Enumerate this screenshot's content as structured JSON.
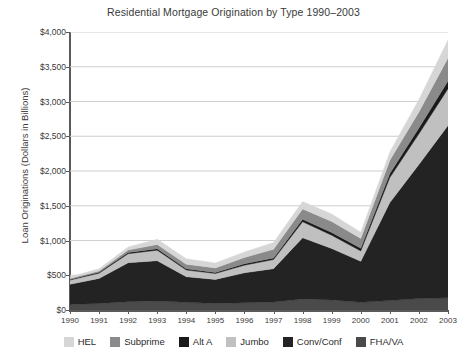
{
  "chart_data": {
    "type": "area",
    "title": "Residential Mortgage Origination by Type 1990–2003",
    "xlabel": "",
    "ylabel": "Loan Originations (Dollars in Billions)",
    "stacked": true,
    "grid": true,
    "legend_position": "bottom",
    "ylim": [
      0,
      4000
    ],
    "ytick_labels": [
      "$4,000",
      "$3,500",
      "$3,000",
      "$2,500",
      "$2,000",
      "$1,500",
      "$1,000",
      "$500",
      "$0"
    ],
    "ytick_values": [
      4000,
      3500,
      3000,
      2500,
      2000,
      1500,
      1000,
      500,
      0
    ],
    "categories": [
      "1990",
      "1991",
      "1992",
      "1993",
      "1994",
      "1995",
      "1996",
      "1997",
      "1998",
      "1999",
      "2000",
      "2001",
      "2002",
      "2003"
    ],
    "stack_order_bottom_to_top": [
      "FHA/VA",
      "Conv/Conf",
      "Jumbo",
      "Alt A",
      "Subprime",
      "HEL"
    ],
    "series": [
      {
        "name": "FHA/VA",
        "color": "#4a4a4a",
        "values": [
          80,
          95,
          120,
          130,
          110,
          95,
          105,
          115,
          160,
          145,
          110,
          135,
          165,
          175
        ]
      },
      {
        "name": "Conv/Conf",
        "color": "#232323",
        "values": [
          290,
          360,
          560,
          580,
          370,
          345,
          430,
          480,
          880,
          740,
          590,
          1410,
          1930,
          2480
        ]
      },
      {
        "name": "Jumbo",
        "color": "#c0c0c0",
        "values": [
          60,
          75,
          130,
          150,
          95,
          85,
          110,
          130,
          230,
          190,
          150,
          360,
          440,
          530
        ]
      },
      {
        "name": "Alt A",
        "color": "#1a1a1a",
        "values": [
          10,
          12,
          18,
          22,
          18,
          16,
          20,
          25,
          35,
          40,
          40,
          60,
          85,
          110
        ]
      },
      {
        "name": "Subprime",
        "color": "#8a8a8a",
        "values": [
          15,
          20,
          35,
          60,
          65,
          65,
          90,
          125,
          150,
          160,
          140,
          190,
          230,
          330
        ]
      },
      {
        "name": "HEL",
        "color": "#d6d6d6",
        "values": [
          25,
          30,
          45,
          75,
          80,
          70,
          80,
          95,
          105,
          105,
          90,
          120,
          180,
          260
        ]
      }
    ],
    "totals": [
      480,
      592,
      908,
      1017,
      738,
      676,
      835,
      970,
      1560,
      1380,
      1120,
      2275,
      3030,
      3885
    ]
  },
  "legend": {
    "items": [
      {
        "label": "HEL",
        "color": "#d6d6d6"
      },
      {
        "label": "Subprime",
        "color": "#8a8a8a"
      },
      {
        "label": "Alt A",
        "color": "#1a1a1a"
      },
      {
        "label": "Jumbo",
        "color": "#c0c0c0"
      },
      {
        "label": "Conv/Conf",
        "color": "#232323"
      },
      {
        "label": "FHA/VA",
        "color": "#4a4a4a"
      }
    ]
  },
  "style": {
    "grid_color": "#cfcfcf",
    "axis_color": "#5a5a5a",
    "text_color": "#3a3a3a",
    "background": "#ffffff"
  }
}
